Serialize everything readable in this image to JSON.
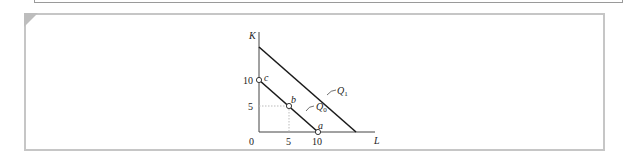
{
  "figure": {
    "type": "isoquant-diagram",
    "axes": {
      "y_label": "K",
      "x_label": "L",
      "origin_label": "0",
      "x_ticks": [
        "5",
        "10"
      ],
      "y_ticks": [
        "5",
        "10"
      ]
    },
    "curves": [
      {
        "name": "Q0",
        "label_main": "Q",
        "label_sub": "0",
        "from": [
          0,
          10
        ],
        "to": [
          10,
          0
        ]
      },
      {
        "name": "Q1",
        "label_main": "Q",
        "label_sub": "1",
        "from": [
          0,
          16
        ],
        "to": [
          16,
          0
        ]
      }
    ],
    "points": [
      {
        "label": "a",
        "L": 10,
        "K": 0
      },
      {
        "label": "b",
        "L": 5,
        "K": 5
      },
      {
        "label": "c",
        "L": 0,
        "K": 10
      }
    ],
    "colors": {
      "lines": "#1a1a1a",
      "dotted_guides": "#b8b8b8",
      "frame": "#c6c6c6"
    }
  }
}
